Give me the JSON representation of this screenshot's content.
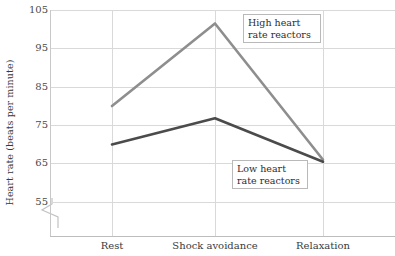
{
  "chart_data": {
    "type": "line",
    "title": "",
    "xlabel": "",
    "ylabel": "Heart rate (beats per minute)",
    "categories": [
      "Rest",
      "Shock avoidance",
      "Relaxation"
    ],
    "yticks": [
      105,
      95,
      85,
      75,
      65,
      55
    ],
    "ylim": [
      55,
      105
    ],
    "y_axis_break": true,
    "grid": true,
    "legend_position": "inline-annotations",
    "series": [
      {
        "name": "High heart rate reactors",
        "color": "#8e8e8e",
        "values": [
          80.0,
          101.5,
          66.0
        ]
      },
      {
        "name": "Low heart rate reactors",
        "color": "#4b4b4b",
        "values": [
          70.0,
          76.8,
          65.5
        ]
      }
    ],
    "annotations": [
      {
        "id": "high",
        "text_line1": "High heart",
        "text_line2": "rate reactors"
      },
      {
        "id": "low",
        "text_line1": "Low heart",
        "text_line2": "rate reactors"
      }
    ]
  },
  "axis": {
    "y_title": "Heart rate (beats per minute)",
    "ytick_labels": [
      "105",
      "95",
      "85",
      "75",
      "65",
      "55"
    ],
    "xtick_labels": [
      "Rest",
      "Shock avoidance",
      "Relaxation"
    ]
  },
  "colors": {
    "grid": "#d9d9d9",
    "axis": "#c2c2c2",
    "series_high": "#8e8e8e",
    "series_low": "#4b4b4b",
    "text": "#3a3a3a",
    "background": "#ffffff"
  }
}
